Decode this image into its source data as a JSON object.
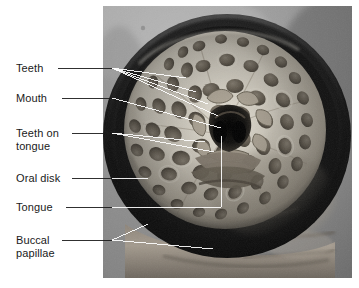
{
  "figure": {
    "kind": "annotated-photograph",
    "background_color": "#ffffff",
    "text_color": "#1a1a1a",
    "leader_color_outside": "#1a1a1a",
    "leader_color_inside": "#ffffff"
  },
  "photo": {
    "x": 103,
    "y": 6,
    "width": 249,
    "height": 272,
    "border_color": "#d9d9d9",
    "palette": {
      "backdrop_light": "#a8a8a8",
      "backdrop_mid": "#8d8d8d",
      "backdrop_dark": "#6f6f6f",
      "rim_black": "#111111",
      "disk_pale": "#ded9cd",
      "disk_light": "#cdc6b8",
      "disk_shadow": "#9d9587",
      "papilla_dark": "#6b6357",
      "papilla_core": "#4a443b",
      "mouth_black": "#0d0d0d",
      "tongue_mid": "#7d7467",
      "flesh_lower": "#9b9186"
    },
    "structures": {
      "oral_disk": "large circular suction disk filling the frame, pale cream, studded with dark oval papillae",
      "mouth": "dark central opening",
      "tongue": "piston-like structure below mouth bearing teeth",
      "teeth": "radial cusps arranged around the mouth",
      "buccal_papillae": "fringe of small papillae around inner margin",
      "rim": "thick dark ring bounding the disk",
      "body": "lower flesh of the animal visible beneath the disk"
    }
  },
  "labels": [
    {
      "id": "teeth",
      "text": "Teeth",
      "lines": [
        "Teeth"
      ],
      "x": 16,
      "y": 62,
      "dash_from": [
        58,
        68
      ],
      "dash_to": [
        112,
        68
      ],
      "targets": [
        [
          186,
          78
        ],
        [
          196,
          92
        ],
        [
          208,
          104
        ],
        [
          218,
          116
        ]
      ]
    },
    {
      "id": "mouth",
      "text": "Mouth",
      "lines": [
        "Mouth"
      ],
      "x": 16,
      "y": 92,
      "dash_from": [
        62,
        98
      ],
      "dash_to": [
        112,
        98
      ],
      "targets": [
        [
          221,
          128
        ]
      ]
    },
    {
      "id": "teeth-on-tongue",
      "text": "Teeth on tongue",
      "lines": [
        "Teeth on",
        "tongue"
      ],
      "x": 16,
      "y": 127,
      "dash_from": [
        72,
        133
      ],
      "dash_to": [
        112,
        133
      ],
      "targets": [
        [
          205,
          142
        ],
        [
          214,
          152
        ]
      ]
    },
    {
      "id": "oral-disk",
      "text": "Oral disk",
      "lines": [
        "Oral disk"
      ],
      "x": 16,
      "y": 172,
      "dash_from": [
        72,
        178
      ],
      "dash_to": [
        112,
        178
      ],
      "targets": [
        [
          148,
          178
        ]
      ]
    },
    {
      "id": "tongue",
      "text": "Tongue",
      "lines": [
        "Tongue"
      ],
      "x": 16,
      "y": 201,
      "dash_from": [
        66,
        207
      ],
      "dash_to": [
        112,
        207
      ],
      "targets": [
        [
          221,
          207
        ],
        [
          221,
          136
        ]
      ]
    },
    {
      "id": "buccal-papillae",
      "text": "Buccal papillae",
      "lines": [
        "Buccal",
        "papillae"
      ],
      "x": 16,
      "y": 234,
      "dash_from": [
        62,
        240
      ],
      "dash_to": [
        112,
        240
      ],
      "targets": [
        [
          148,
          224
        ],
        [
          213,
          249
        ]
      ]
    }
  ]
}
